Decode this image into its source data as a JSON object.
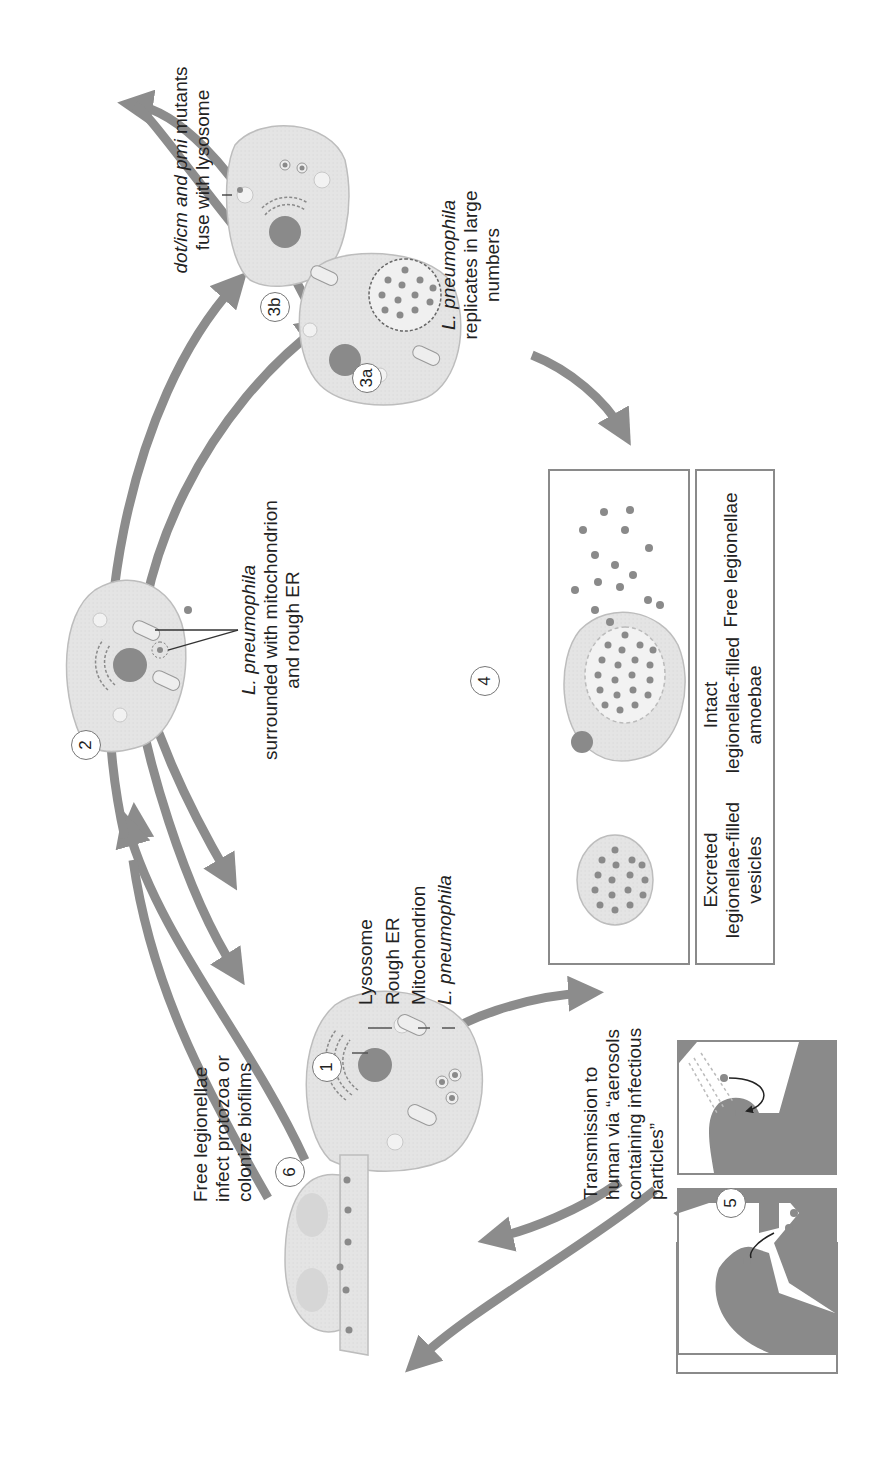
{
  "diagram": {
    "colors": {
      "arrow": "#8c8c8c",
      "cell_fill": "#e6e6e6",
      "cell_stroke": "#bdbdbd",
      "nucleus": "#8a8a8a",
      "bacterium": "#8a8a8a",
      "text": "#222222"
    },
    "steps": [
      {
        "id": "1",
        "label": "1"
      },
      {
        "id": "2",
        "label": "2"
      },
      {
        "id": "3a",
        "label": "3a"
      },
      {
        "id": "3b",
        "label": "3b"
      },
      {
        "id": "4",
        "label": "4"
      },
      {
        "id": "5",
        "label": "5"
      },
      {
        "id": "6",
        "label": "6"
      }
    ],
    "step1": {
      "organelle_labels": [
        "Lysosome",
        "Rough ER",
        "Mitochondrion",
        "L. pneumophila"
      ]
    },
    "step2": {
      "caption_italic": "L. pneumophila",
      "caption_line2": "surrounded with mitochondrion",
      "caption_line3": "and rough ER"
    },
    "step3a": {
      "caption_italic": "L. pneumophila",
      "caption_line2": "replicates in large",
      "caption_line3": "numbers"
    },
    "step3b": {
      "caption_italic": "dot/icm and pmi",
      "caption_rest": " mutants",
      "caption_line2": "fuse with lysosome"
    },
    "step4": {
      "panels": [
        {
          "line1": "Excreted",
          "line2": "legionellae-filled",
          "line3": "vesicles"
        },
        {
          "line1": "Intact",
          "line2": "legionellae-filled",
          "line3": "amoebae"
        },
        {
          "line1": "Free legionellae",
          "line2": "",
          "line3": ""
        }
      ]
    },
    "step5": {
      "caption_line1": "Transmission to",
      "caption_line2": "human via “aerosols",
      "caption_line3": "containing infectious",
      "caption_line4": "particles”",
      "scenes": [
        "shower aerosol inhalation",
        "sink/faucet aerosol inhalation"
      ]
    },
    "step6": {
      "caption_line1": "Free legionellae",
      "caption_line2": "infect protozoa or",
      "caption_line3": "colonize biofilms"
    }
  }
}
